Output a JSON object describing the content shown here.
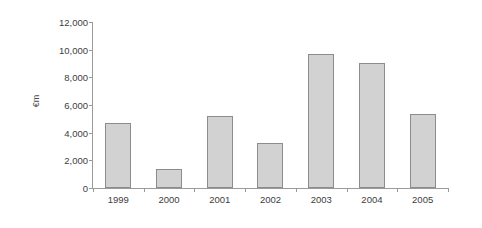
{
  "chart_data": {
    "type": "bar",
    "title": "",
    "subtitle": "",
    "xlabel": "",
    "ylabel": "€m",
    "categories": [
      "1999",
      "2000",
      "2001",
      "2002",
      "2003",
      "2004",
      "2005"
    ],
    "values": [
      4700,
      1370,
      5200,
      3250,
      9690,
      9030,
      5350
    ],
    "series": [
      {
        "name": "",
        "values": [
          4700,
          1370,
          5200,
          3250,
          9690,
          9030,
          5350
        ]
      }
    ],
    "ylim": [
      0,
      12000
    ],
    "ytick_values": [
      0,
      2000,
      4000,
      6000,
      8000,
      10000,
      12000
    ],
    "ytick_labels": [
      "0",
      "2,000",
      "4,000",
      "6,000",
      "8,000",
      "10,000",
      "12,000"
    ],
    "grid": false,
    "legend": false,
    "legend_position": "none",
    "bar_fill_color": "#d2d2d2",
    "bar_border_color": "#8c8c8c",
    "axis_color": "#9a9a9a",
    "text_color": "#3d3d3d",
    "background_color": "#ffffff"
  }
}
